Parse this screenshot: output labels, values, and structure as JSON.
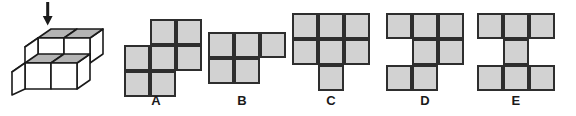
{
  "figure": {
    "arrow": {
      "name": "down-arrow-indicator",
      "direction": "down"
    },
    "cube_count": 9,
    "colors": {
      "face_top": "#b4b4b4",
      "face_front": "#ffffff",
      "face_side": "#ffffff",
      "outline": "#1a1a1a"
    }
  },
  "style": {
    "cell_fill": "#d2d2d2",
    "cell_border": "#2e2e2e",
    "background": "#ffffff",
    "label_color": "#1a1a1a"
  },
  "options": [
    {
      "label": "A",
      "name": "option-a",
      "cols": 3,
      "rows": 3,
      "cell": 26,
      "offset_x": 14,
      "offset_y": 19,
      "cells": [
        [
          0,
          1
        ],
        [
          0,
          2
        ],
        [
          1,
          0
        ],
        [
          1,
          1
        ],
        [
          1,
          2
        ],
        [
          2,
          0
        ],
        [
          2,
          1
        ]
      ]
    },
    {
      "label": "B",
      "name": "option-b",
      "cols": 3,
      "rows": 2,
      "cell": 26,
      "offset_x": 12,
      "offset_y": 32,
      "cells": [
        [
          0,
          0
        ],
        [
          0,
          1
        ],
        [
          0,
          2
        ],
        [
          1,
          0
        ],
        [
          1,
          1
        ]
      ]
    },
    {
      "label": "C",
      "name": "option-c",
      "cols": 3,
      "rows": 3,
      "cell": 26,
      "offset_x": 7,
      "offset_y": 13,
      "cells": [
        [
          0,
          0
        ],
        [
          0,
          1
        ],
        [
          0,
          2
        ],
        [
          1,
          0
        ],
        [
          1,
          1
        ],
        [
          1,
          2
        ],
        [
          2,
          1
        ]
      ]
    },
    {
      "label": "D",
      "name": "option-d",
      "cols": 3,
      "rows": 3,
      "cell": 26,
      "offset_x": 7,
      "offset_y": 13,
      "cells": [
        [
          0,
          0
        ],
        [
          0,
          1
        ],
        [
          0,
          2
        ],
        [
          1,
          1
        ],
        [
          1,
          2
        ],
        [
          2,
          0
        ],
        [
          2,
          1
        ]
      ]
    },
    {
      "label": "E",
      "name": "option-e",
      "cols": 3,
      "rows": 3,
      "cell": 26,
      "offset_x": 7,
      "offset_y": 13,
      "cells": [
        [
          0,
          0
        ],
        [
          0,
          1
        ],
        [
          0,
          2
        ],
        [
          1,
          1
        ],
        [
          2,
          0
        ],
        [
          2,
          1
        ],
        [
          2,
          2
        ]
      ]
    }
  ],
  "layout": {
    "option_x": [
      110,
      196,
      285,
      379,
      470
    ]
  }
}
